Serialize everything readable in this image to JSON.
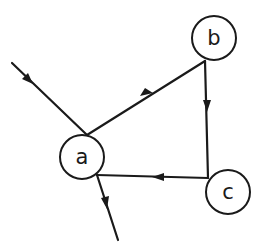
{
  "diagram": {
    "type": "directed-graph",
    "nodes": [
      {
        "id": "a",
        "label": "a",
        "cx": 82,
        "cy": 157,
        "r": 22
      },
      {
        "id": "b",
        "label": "b",
        "cx": 214,
        "cy": 38,
        "r": 22
      },
      {
        "id": "c",
        "label": "c",
        "cx": 228,
        "cy": 192,
        "r": 22
      }
    ],
    "edges": [
      {
        "from": "external-in",
        "to": "a"
      },
      {
        "from": "a",
        "to": "b"
      },
      {
        "from": "b",
        "to": "c"
      },
      {
        "from": "c",
        "to": "a"
      },
      {
        "from": "a",
        "to": "external-out"
      }
    ],
    "colors": {
      "stroke": "#1a1a1a",
      "background": "#ffffff"
    }
  }
}
